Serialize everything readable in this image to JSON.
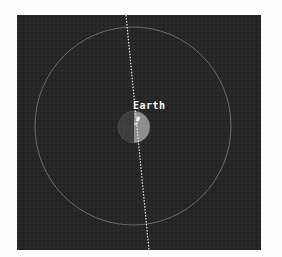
{
  "scene": {
    "background_color": "#262626",
    "orbit": {
      "color": "#8a8a8a",
      "cx": 116,
      "cy": 111,
      "rx": 98,
      "ry": 99
    },
    "axis_line": {
      "color": "#e6e6e6",
      "x1": 109,
      "y1": 0,
      "x2": 132,
      "y2": 235
    },
    "body": {
      "name": "Earth",
      "cx": 117,
      "cy": 112,
      "r": 16,
      "day_color": "#8e8e8e",
      "night_color": "#3d3d3d"
    },
    "label": {
      "text": "Earth"
    }
  }
}
